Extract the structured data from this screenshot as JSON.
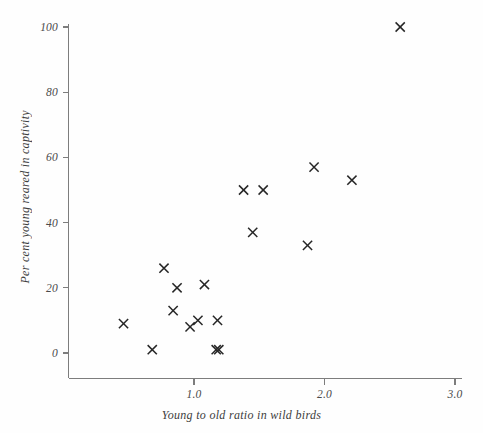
{
  "chart_data": {
    "type": "scatter",
    "title": "",
    "subtitle": "",
    "xlabel": "Young to old ratio in wild birds",
    "ylabel": "Per cent young reared in captivity",
    "xlim": [
      0.32,
      3.0
    ],
    "ylim": [
      -6,
      103
    ],
    "xticks": [
      "1.0",
      "2.0",
      "3.0"
    ],
    "xtick_values": [
      1.0,
      2.0,
      3.0
    ],
    "yticks": [
      "0",
      "20",
      "40",
      "60",
      "80",
      "100"
    ],
    "ytick_values": [
      0,
      20,
      40,
      60,
      80,
      100
    ],
    "grid": false,
    "legend": null,
    "marker": "x-cross",
    "marker_color": "#262626",
    "axis_color": "#7d7d7d",
    "n_points": 19,
    "points": [
      {
        "x": 0.46,
        "y": 9
      },
      {
        "x": 0.68,
        "y": 1
      },
      {
        "x": 0.77,
        "y": 26
      },
      {
        "x": 0.87,
        "y": 20
      },
      {
        "x": 0.84,
        "y": 13
      },
      {
        "x": 0.97,
        "y": 8
      },
      {
        "x": 1.03,
        "y": 10
      },
      {
        "x": 1.08,
        "y": 21
      },
      {
        "x": 1.18,
        "y": 10
      },
      {
        "x": 1.17,
        "y": 1
      },
      {
        "x": 1.19,
        "y": 1
      },
      {
        "x": 1.38,
        "y": 50
      },
      {
        "x": 1.45,
        "y": 37
      },
      {
        "x": 1.53,
        "y": 50
      },
      {
        "x": 1.92,
        "y": 57
      },
      {
        "x": 1.87,
        "y": 33
      },
      {
        "x": 2.21,
        "y": 53
      },
      {
        "x": 2.58,
        "y": 100
      }
    ]
  },
  "figure": {
    "background": "#fefefe",
    "axis_color": "#7d7d7d",
    "text_color": "#3d3d3d"
  }
}
